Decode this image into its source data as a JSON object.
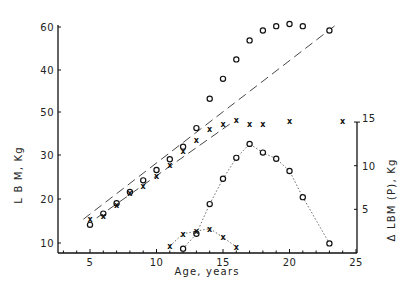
{
  "chart_data": {
    "type": "scatter",
    "title": "",
    "xlabel": "Age, years",
    "ylabel_left": "L B M, Kg",
    "ylabel_right": "Δ LBM (P), Kg",
    "xlim": [
      2.5,
      25
    ],
    "ylim_left": [
      8,
      62
    ],
    "ylim_right": [
      0,
      15
    ],
    "grid": false,
    "legend": null,
    "x_ticks": [
      5,
      10,
      15,
      20,
      25
    ],
    "x_tick_labels": [
      "5",
      "10",
      "15",
      "20",
      "25"
    ],
    "y_left_ticks_px": [
      27,
      70,
      112,
      155,
      199,
      243
    ],
    "y_left_tick_labels": [
      "60",
      "40",
      "50",
      "30",
      "20",
      "10"
    ],
    "y_right_ticks": [
      5,
      10,
      15
    ],
    "y_right_tick_labels": [
      "5",
      "10",
      "15"
    ],
    "series": [
      {
        "name": "LBM (circles, upper)",
        "marker": "o",
        "axis": "left",
        "x": [
          5,
          6,
          7,
          8,
          9,
          10,
          11,
          12,
          13,
          14,
          15,
          16,
          17,
          18,
          19,
          20,
          21,
          23
        ],
        "values": [
          14.2,
          16.8,
          19.2,
          21.8,
          24.5,
          26.9,
          29.4,
          32.3,
          36.6,
          43.4,
          48,
          52.5,
          56.9,
          59.2,
          60.2,
          60.7,
          60.2,
          59.2
        ]
      },
      {
        "name": "LBM (x, upper)",
        "marker": "x",
        "axis": "left",
        "x": [
          5,
          6,
          7,
          8,
          9,
          10,
          11,
          12,
          13,
          14,
          15,
          16,
          17,
          18,
          20,
          24
        ],
        "values": [
          15.6,
          16.3,
          18.7,
          21.5,
          23.2,
          25.5,
          28.0,
          31.2,
          33.8,
          36.5,
          37.5,
          38.4,
          37.5,
          37.5,
          38.2,
          38.2
        ]
      },
      {
        "name": "Δ LBM(P) (circles, lower)",
        "marker": "o",
        "axis": "right",
        "line": "dotted",
        "x": [
          12,
          13,
          14,
          15,
          16,
          17,
          18,
          19,
          20,
          21,
          23
        ],
        "values": [
          0.5,
          2.2,
          5.6,
          8.5,
          10.9,
          12.5,
          11.5,
          10.8,
          9.4,
          6.4,
          1.1
        ]
      },
      {
        "name": "Δ LBM(P) (x, lower)",
        "marker": "x",
        "axis": "right",
        "line": "dotted",
        "x": [
          11,
          12,
          13,
          14,
          15,
          16
        ],
        "values": [
          0.8,
          2.2,
          2.5,
          2.8,
          1.8,
          0.7
        ]
      },
      {
        "name": "Reference line (long dash, upper)",
        "marker": "none",
        "axis": "left",
        "line": "dashed",
        "x": [
          4.5,
          23.5
        ],
        "values": [
          15.5,
          60.5
        ]
      },
      {
        "name": "Reference line (long dash, lower)",
        "marker": "none",
        "axis": "left",
        "line": "dashed",
        "x": [
          5.5,
          15.5
        ],
        "values": [
          15.8,
          37.5
        ]
      }
    ]
  },
  "labels": {
    "xlabel": "Age, years",
    "ylabel_left": "L B M, Kg",
    "ylabel_right": "Δ LBM (P), Kg"
  }
}
